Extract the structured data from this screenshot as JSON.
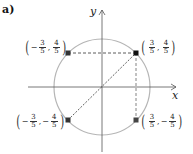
{
  "part_label": "a)",
  "axes": {
    "x_label": "x",
    "y_label": "y"
  },
  "circle": {
    "center_px": [
      102,
      87
    ],
    "radius_px": 48,
    "color": "#b0b0b0"
  },
  "points": [
    {
      "id": "q1",
      "label": {
        "x_sign": "",
        "x_num": "3",
        "x_den": "5",
        "y_sign": "",
        "y_num": "4",
        "y_den": "5"
      }
    },
    {
      "id": "q2",
      "label": {
        "x_sign": "−",
        "x_num": "3",
        "x_den": "5",
        "y_sign": "",
        "y_num": "4",
        "y_den": "5"
      }
    },
    {
      "id": "q3",
      "label": {
        "x_sign": "−",
        "x_num": "3",
        "x_den": "5",
        "y_sign": "−",
        "y_num": "4",
        "y_den": "5"
      }
    },
    {
      "id": "q4",
      "label": {
        "x_sign": "",
        "x_num": "3",
        "x_den": "5",
        "y_sign": "−",
        "y_num": "4",
        "y_den": "5"
      }
    }
  ],
  "colors": {
    "axis": "#444444",
    "dashed": "#333333",
    "point": "#222222"
  }
}
